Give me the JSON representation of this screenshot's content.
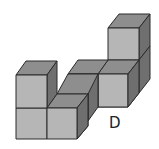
{
  "figure": {
    "label": "D",
    "colors": {
      "top_face": "#8e8e8e",
      "front_face": "#b6b6b6",
      "side_face": "#6f6f6f",
      "edge": "#2b2b2b"
    },
    "cube_count": 7
  }
}
